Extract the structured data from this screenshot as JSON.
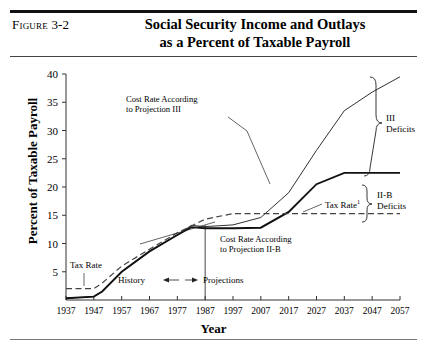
{
  "figure": {
    "label_word": "Figure",
    "label_number": "3-2",
    "title_line1": "Social Security Income and Outlays",
    "title_line2": "as a Percent of Taxable Payroll"
  },
  "chart_data": {
    "type": "line",
    "title": "Social Security Income and Outlays as a Percent of Taxable Payroll",
    "xlabel": "Year",
    "ylabel": "Percent of Taxable Payroll",
    "xlim": [
      1937,
      2057
    ],
    "ylim": [
      0,
      40
    ],
    "ytick_values": [
      5,
      10,
      15,
      20,
      25,
      30,
      35,
      40
    ],
    "ytick_labels": [
      "5",
      "10",
      "15",
      "20",
      "25",
      "30",
      "35",
      "40"
    ],
    "xtick_labels": [
      "1937",
      "1947",
      "1957",
      "1967",
      "1977",
      "1987",
      "1997",
      "2007",
      "2017",
      "2027",
      "2037",
      "2047",
      "2057"
    ],
    "grid": false,
    "legend": "none",
    "series": [
      {
        "name": "Cost Rate According to Projection III",
        "style": "solid-thin",
        "x": [
          1937,
          1947,
          1950,
          1957,
          1967,
          1977,
          1982,
          1987,
          1997,
          2007,
          2017,
          2027,
          2037,
          2047,
          2057
        ],
        "values": [
          0.3,
          0.6,
          1.5,
          5.0,
          8.6,
          11.5,
          13.2,
          13.0,
          13.3,
          14.6,
          19.0,
          26.5,
          33.5,
          36.8,
          39.5
        ]
      },
      {
        "name": "Cost Rate According to Projection II-B",
        "style": "solid-thick",
        "x": [
          1937,
          1947,
          1950,
          1957,
          1967,
          1977,
          1982,
          1987,
          1997,
          2007,
          2017,
          2027,
          2037,
          2047,
          2057
        ],
        "values": [
          0.3,
          0.6,
          1.5,
          5.0,
          8.6,
          11.5,
          12.9,
          12.7,
          12.7,
          12.8,
          15.6,
          20.5,
          22.5,
          22.5,
          22.5
        ]
      },
      {
        "name": "Tax Rate",
        "style": "dashed",
        "x": [
          1937,
          1947,
          1950,
          1957,
          1967,
          1977,
          1987,
          1997,
          2007,
          2017,
          2027,
          2037,
          2047,
          2057
        ],
        "values": [
          2.0,
          2.0,
          3.0,
          6.0,
          9.0,
          11.9,
          14.3,
          15.3,
          15.3,
          15.3,
          15.3,
          15.3,
          15.3,
          15.3
        ]
      }
    ],
    "annotations": [
      {
        "name": "cost-rate-iii-label",
        "text_line1": "Cost Rate According",
        "text_line2": "to Projection III"
      },
      {
        "name": "cost-rate-iib-label",
        "text_line1": "Cost Rate According",
        "text_line2": "to Projection II-B"
      },
      {
        "name": "tax-rate-label-left",
        "text": "Tax Rate"
      },
      {
        "name": "tax-rate-label-right",
        "text": "Tax Rate",
        "superscript": "1"
      },
      {
        "name": "history-label",
        "text": "History"
      },
      {
        "name": "projections-label",
        "text": "Projections"
      },
      {
        "name": "brace-iii-label",
        "text_line1": "III",
        "text_line2": "Deficits"
      },
      {
        "name": "brace-iib-label",
        "text_line1": "II-B",
        "text_line2": "Deficits"
      }
    ],
    "divider_year": 1987
  }
}
